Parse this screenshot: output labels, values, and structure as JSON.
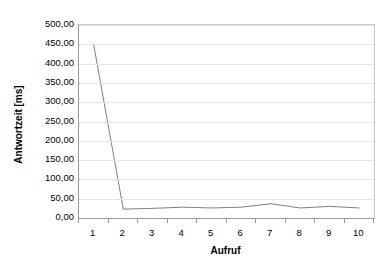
{
  "chart_data": {
    "type": "line",
    "title": "",
    "xlabel": "Aufruf",
    "ylabel": "Antwortzeit [ms]",
    "categories": [
      "1",
      "2",
      "3",
      "4",
      "5",
      "6",
      "7",
      "8",
      "9",
      "10"
    ],
    "values": [
      448,
      23,
      25,
      28,
      26,
      28,
      37,
      26,
      30,
      26
    ],
    "series": [
      {
        "name": "Antwortzeit",
        "values": [
          448,
          23,
          25,
          28,
          26,
          28,
          37,
          26,
          30,
          26
        ]
      }
    ],
    "ylim": [
      0,
      500
    ],
    "ytick_step": 50,
    "ytick_labels": [
      "500,00",
      "450,00",
      "400,00",
      "350,00",
      "300,00",
      "250,00",
      "200,00",
      "150,00",
      "100,00",
      "50,00",
      "0,00"
    ],
    "ytick_values": [
      500,
      450,
      400,
      350,
      300,
      250,
      200,
      150,
      100,
      50,
      0
    ],
    "grid": true,
    "grid_axis": "y",
    "legend": "none",
    "line_color": "#7f7f7f",
    "grid_color": "#e6e6e6",
    "axis_color": "#9a9a9a",
    "background": "#ffffff",
    "decimal_separator": ","
  }
}
